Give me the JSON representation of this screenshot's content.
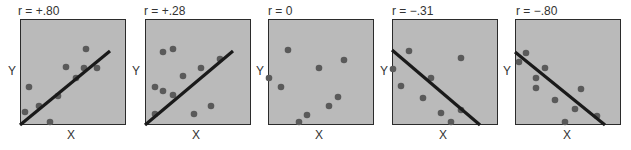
{
  "colors": {
    "plot_bg": "#bababa",
    "border": "#2b2b2b",
    "dot": "#5a5a5a",
    "line": "#1a1a1a"
  },
  "chart_data": [
    {
      "type": "scatter",
      "title": "r = +.80",
      "xlabel": "X",
      "ylabel": "Y",
      "points": [
        [
          66,
          30
        ],
        [
          46,
          48
        ],
        [
          64,
          49
        ],
        [
          77,
          49
        ],
        [
          56,
          59
        ],
        [
          9,
          68
        ],
        [
          38,
          77
        ],
        [
          19,
          87
        ],
        [
          5,
          93
        ],
        [
          30,
          103
        ]
      ],
      "regression_line": [
        [
          0,
          106
        ],
        [
          90,
          32
        ]
      ]
    },
    {
      "type": "scatter",
      "title": "r = +.28",
      "xlabel": "X",
      "ylabel": "Y",
      "points": [
        [
          18,
          33
        ],
        [
          28,
          30
        ],
        [
          75,
          40
        ],
        [
          56,
          49
        ],
        [
          38,
          57
        ],
        [
          10,
          68
        ],
        [
          18,
          72
        ],
        [
          28,
          76
        ],
        [
          66,
          87
        ],
        [
          49,
          95
        ],
        [
          10,
          95
        ]
      ],
      "regression_line": [
        [
          0,
          106
        ],
        [
          88,
          32
        ]
      ]
    },
    {
      "type": "scatter",
      "title": "r = 0",
      "xlabel": "X",
      "ylabel": "Y",
      "points": [
        [
          20,
          31
        ],
        [
          76,
          41
        ],
        [
          51,
          49
        ],
        [
          1,
          59
        ],
        [
          13,
          68
        ],
        [
          70,
          78
        ],
        [
          61,
          87
        ],
        [
          39,
          96
        ],
        [
          31,
          103
        ]
      ],
      "regression_line": null
    },
    {
      "type": "scatter",
      "title": "r = −.31",
      "xlabel": "X",
      "ylabel": "Y",
      "points": [
        [
          17,
          32
        ],
        [
          69,
          39
        ],
        [
          1,
          50
        ],
        [
          39,
          59
        ],
        [
          9,
          67
        ],
        [
          31,
          79
        ],
        [
          69,
          91
        ],
        [
          49,
          94
        ],
        [
          59,
          103
        ]
      ],
      "regression_line": [
        [
          0,
          31
        ],
        [
          88,
          106
        ]
      ]
    },
    {
      "type": "scatter",
      "title": "r = −.80",
      "xlabel": "X",
      "ylabel": "Y",
      "points": [
        [
          11,
          34
        ],
        [
          4,
          43
        ],
        [
          30,
          49
        ],
        [
          21,
          59
        ],
        [
          21,
          69
        ],
        [
          66,
          70
        ],
        [
          40,
          81
        ],
        [
          60,
          90
        ],
        [
          82,
          97
        ],
        [
          50,
          103
        ]
      ],
      "regression_line": [
        [
          0,
          33
        ],
        [
          90,
          106
        ]
      ]
    }
  ]
}
